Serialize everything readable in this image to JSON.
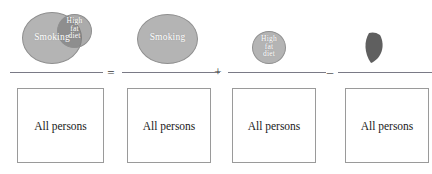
{
  "figure": {
    "type": "venn-fraction-equation",
    "colors": {
      "circle_fill": "#b4b4b4",
      "circle_stroke": "#8f8f8f",
      "intersection_fill": "#5f5f5f",
      "box_stroke": "#9a9a9a",
      "bar_color": "#7a7a86",
      "label_text": "#ffffff",
      "box_text": "#1a1a1a",
      "background": "#ffffff"
    }
  },
  "terms": [
    {
      "id": "union",
      "numerator_kind": "two-overlapping-circles",
      "shapes": [
        {
          "name": "smoking-circle",
          "label": "Smoking"
        },
        {
          "name": "high-fat-diet-circle",
          "label": "High fat diet"
        }
      ],
      "denominator": "All persons"
    },
    {
      "id": "smoking",
      "numerator_kind": "single-circle",
      "shapes": [
        {
          "name": "smoking-circle",
          "label": "Smoking"
        }
      ],
      "denominator": "All persons"
    },
    {
      "id": "high-fat-diet",
      "numerator_kind": "single-circle",
      "shapes": [
        {
          "name": "high-fat-diet-circle",
          "label": "High fat diet"
        }
      ],
      "denominator": "All persons"
    },
    {
      "id": "intersection",
      "numerator_kind": "lens",
      "shapes": [
        {
          "name": "intersection-lens",
          "label": ""
        }
      ],
      "denominator": "All persons"
    }
  ],
  "labels": {
    "smoking": "Smoking",
    "high_fat_diet_line1": "High",
    "high_fat_diet_line2": "fat",
    "high_fat_diet_line3": "diet",
    "all_persons": "All persons"
  },
  "operators": {
    "equals": "=",
    "plus": "+",
    "minus": "–"
  }
}
